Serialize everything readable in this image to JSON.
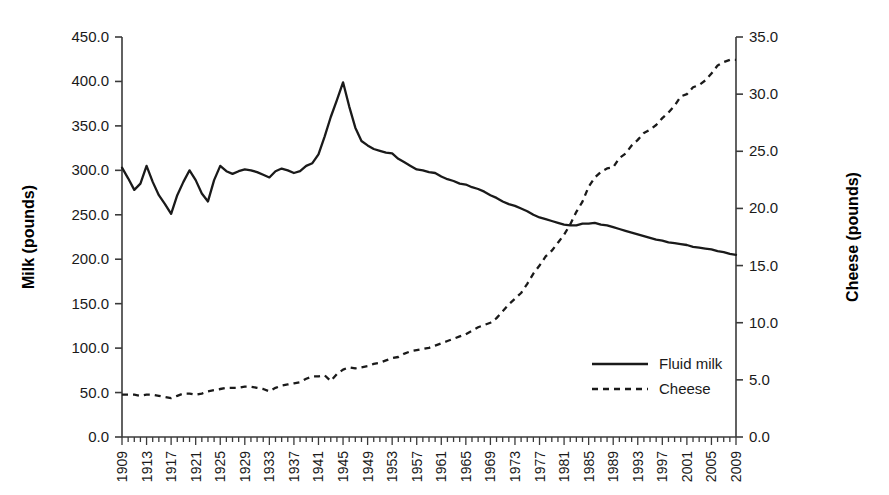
{
  "chart_data": {
    "type": "line",
    "title": "",
    "xlabel": "",
    "ylabel": "Milk (pounds)",
    "y2label": "Cheese (pounds)",
    "grid": false,
    "legend_position": "inside-right",
    "xlim": [
      1909,
      2009
    ],
    "ylim": [
      0.0,
      450.0
    ],
    "y2lim": [
      0.0,
      35.0
    ],
    "y_ticks": [
      "0.0",
      "50.0",
      "100.0",
      "150.0",
      "200.0",
      "250.0",
      "300.0",
      "350.0",
      "400.0",
      "450.0"
    ],
    "y2_ticks": [
      "0.0",
      "5.0",
      "10.0",
      "15.0",
      "20.0",
      "25.0",
      "30.0",
      "35.0"
    ],
    "x_tick_labels": [
      "1909",
      "1913",
      "1917",
      "1921",
      "1925",
      "1929",
      "1933",
      "1937",
      "1941",
      "1945",
      "1949",
      "1953",
      "1957",
      "1961",
      "1965",
      "1969",
      "1973",
      "1977",
      "1981",
      "1985",
      "1989",
      "1993",
      "1997",
      "2001",
      "2005",
      "2009"
    ],
    "x": [
      1909,
      1910,
      1911,
      1912,
      1913,
      1914,
      1915,
      1916,
      1917,
      1918,
      1919,
      1920,
      1921,
      1922,
      1923,
      1924,
      1925,
      1926,
      1927,
      1928,
      1929,
      1930,
      1931,
      1932,
      1933,
      1934,
      1935,
      1936,
      1937,
      1938,
      1939,
      1940,
      1941,
      1942,
      1943,
      1944,
      1945,
      1946,
      1947,
      1948,
      1949,
      1950,
      1951,
      1952,
      1953,
      1954,
      1955,
      1956,
      1957,
      1958,
      1959,
      1960,
      1961,
      1962,
      1963,
      1964,
      1965,
      1966,
      1967,
      1968,
      1969,
      1970,
      1971,
      1972,
      1973,
      1974,
      1975,
      1976,
      1977,
      1978,
      1979,
      1980,
      1981,
      1982,
      1983,
      1984,
      1985,
      1986,
      1987,
      1988,
      1989,
      1990,
      1991,
      1992,
      1993,
      1994,
      1995,
      1996,
      1997,
      1998,
      1999,
      2000,
      2001,
      2002,
      2003,
      2004,
      2005,
      2006,
      2007,
      2008,
      2009
    ],
    "series": [
      {
        "name": "Fluid milk",
        "axis": "left",
        "style": "solid",
        "color": "#1a1a1a",
        "values": [
          303,
          291,
          278,
          285,
          305,
          287,
          272,
          262,
          251,
          272,
          287,
          300,
          289,
          274,
          265,
          289,
          305,
          299,
          296,
          299,
          301,
          300,
          298,
          295,
          292,
          299,
          302,
          300,
          297,
          299,
          305,
          308,
          318,
          338,
          360,
          379,
          399,
          372,
          348,
          333,
          328,
          324,
          322,
          320,
          319,
          313,
          309,
          305,
          301,
          300,
          298,
          297,
          293,
          290,
          288,
          285,
          284,
          281,
          279,
          276,
          272,
          269,
          265,
          262,
          260,
          257,
          254,
          250,
          247,
          245,
          243,
          241,
          239,
          238,
          238,
          240,
          240,
          241,
          239,
          238,
          236,
          234,
          232,
          230,
          228,
          226,
          224,
          222,
          221,
          219,
          218,
          217,
          216,
          214,
          213,
          212,
          211,
          209,
          208,
          206,
          205
        ]
      },
      {
        "name": "Cheese",
        "axis": "right",
        "style": "dashed",
        "color": "#1a1a1a",
        "values": [
          3.7,
          3.7,
          3.7,
          3.6,
          3.7,
          3.7,
          3.6,
          3.5,
          3.4,
          3.6,
          3.8,
          3.8,
          3.7,
          3.8,
          4.0,
          4.1,
          4.2,
          4.3,
          4.3,
          4.3,
          4.4,
          4.4,
          4.3,
          4.2,
          4.0,
          4.3,
          4.5,
          4.6,
          4.7,
          4.8,
          5.1,
          5.3,
          5.3,
          5.4,
          4.9,
          5.5,
          5.9,
          6.1,
          6.0,
          6.1,
          6.2,
          6.4,
          6.5,
          6.7,
          6.9,
          7.0,
          7.3,
          7.5,
          7.6,
          7.7,
          7.8,
          8.0,
          8.2,
          8.4,
          8.6,
          8.8,
          9.0,
          9.3,
          9.6,
          9.8,
          10.0,
          10.4,
          11.0,
          11.6,
          12.1,
          12.6,
          13.4,
          14.3,
          15.0,
          15.8,
          16.3,
          17.0,
          17.7,
          18.6,
          19.7,
          20.6,
          21.9,
          22.7,
          23.2,
          23.5,
          23.6,
          24.4,
          24.8,
          25.5,
          26.0,
          26.6,
          26.9,
          27.3,
          27.9,
          28.4,
          29.0,
          29.8,
          30.0,
          30.6,
          30.8,
          31.2,
          31.8,
          32.5,
          32.8,
          33.0,
          33.0
        ]
      }
    ]
  },
  "axes": {
    "left_title": "Milk (pounds)",
    "right_title": "Cheese (pounds)"
  },
  "legend": {
    "items": [
      {
        "label": "Fluid milk",
        "style": "solid"
      },
      {
        "label": "Cheese",
        "style": "dashed"
      }
    ]
  }
}
